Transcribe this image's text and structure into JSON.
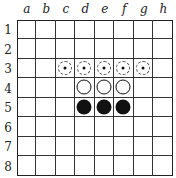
{
  "board": {
    "columns": [
      "a",
      "b",
      "c",
      "d",
      "e",
      "f",
      "g",
      "h"
    ],
    "rows": [
      "1",
      "2",
      "3",
      "4",
      "5",
      "6",
      "7",
      "8"
    ],
    "pieces": [
      {
        "square": "d4",
        "color": "white"
      },
      {
        "square": "e4",
        "color": "white"
      },
      {
        "square": "f4",
        "color": "white"
      },
      {
        "square": "d5",
        "color": "black"
      },
      {
        "square": "e5",
        "color": "black"
      },
      {
        "square": "f5",
        "color": "black"
      }
    ],
    "legal_move_hints": [
      "c3",
      "d3",
      "e3",
      "f3",
      "g3"
    ],
    "colors": {
      "black_piece": "#111111",
      "white_piece": "#ffffff",
      "grid_line": "#333333"
    }
  }
}
